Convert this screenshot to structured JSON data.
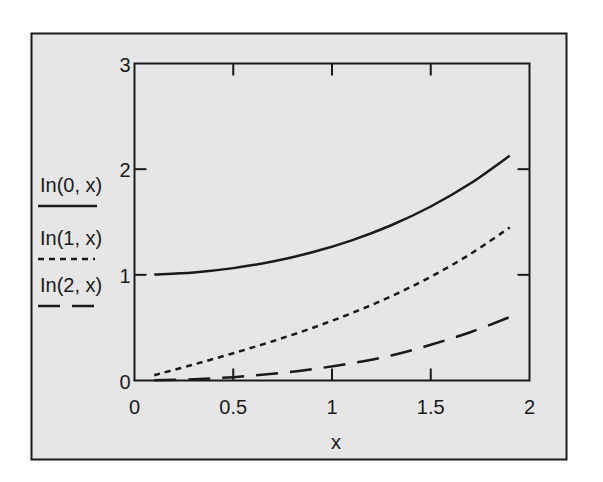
{
  "chart_data": {
    "type": "line",
    "title": "",
    "xlabel": "x",
    "ylabel": "",
    "xlim": [
      0,
      2
    ],
    "ylim": [
      0,
      3
    ],
    "grid": false,
    "legend_position": "left",
    "x_ticks": [
      "0",
      "0.5",
      "1",
      "1.5",
      "2"
    ],
    "y_ticks": [
      "0",
      "1",
      "2",
      "3"
    ],
    "x": [
      0.1,
      0.3,
      0.5,
      0.7,
      0.9,
      1.1,
      1.3,
      1.5,
      1.7,
      1.9
    ],
    "series": [
      {
        "name": "In(0,x)",
        "style": "solid",
        "values": [
          1.0025,
          1.0226,
          1.0635,
          1.1263,
          1.213,
          1.3262,
          1.4693,
          1.6467,
          1.864,
          2.1277
        ]
      },
      {
        "name": "In(1,x)",
        "style": "dotted",
        "values": [
          0.0501,
          0.1517,
          0.2579,
          0.3719,
          0.4971,
          0.6375,
          0.7973,
          0.9817,
          1.1963,
          1.4482
        ]
      },
      {
        "name": "In(2,x)",
        "style": "dashed",
        "values": [
          0.0013,
          0.0113,
          0.0319,
          0.0634,
          0.1069,
          0.1639,
          0.2369,
          0.3378,
          0.457,
          0.6
        ]
      }
    ]
  },
  "colors": {
    "background": "#e6e6e6",
    "line": "#1a1a1a"
  }
}
